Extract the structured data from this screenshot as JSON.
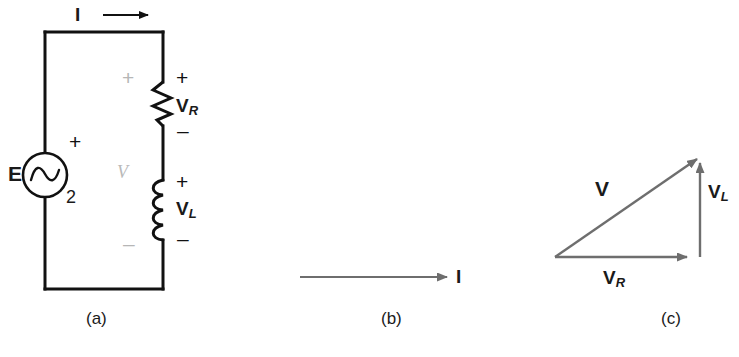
{
  "figure": {
    "panels": [
      {
        "id": "a",
        "caption": "(a)",
        "type": "circuit-schematic",
        "description": "Series RL circuit with AC source",
        "source": {
          "symbol": "ac-source",
          "label": "E",
          "subscript_label": "2",
          "polarity_plus": "+"
        },
        "elements": [
          {
            "name": "resistor",
            "label": "V",
            "label_subscript": "R",
            "polarity_plus": "+",
            "polarity_minus": "–"
          },
          {
            "name": "inductor",
            "label": "V",
            "label_subscript": "L",
            "polarity_plus": "+",
            "polarity_minus": "–"
          }
        ],
        "loop_voltage_label": "V",
        "loop_polarity_plus": "+",
        "loop_polarity_minus": "–",
        "current_label": "I"
      },
      {
        "id": "b",
        "caption": "(b)",
        "type": "phasor-single",
        "description": "Current phasor reference",
        "phasors": [
          {
            "name": "current",
            "label": "I",
            "label_subscript": ""
          }
        ]
      },
      {
        "id": "c",
        "caption": "(c)",
        "type": "phasor-triangle",
        "description": "Voltage phasor triangle for series RL circuit",
        "phasors": [
          {
            "name": "resistor-voltage",
            "label": "V",
            "label_subscript": "R"
          },
          {
            "name": "inductor-voltage",
            "label": "V",
            "label_subscript": "L"
          },
          {
            "name": "total-voltage",
            "label": "V",
            "label_subscript": ""
          }
        ]
      }
    ]
  },
  "colors": {
    "ink": "#1a1a1a",
    "wire": "#111111",
    "phasor": "#6b6b6b",
    "ghost": "#b6b6b6",
    "background": "#ffffff"
  }
}
